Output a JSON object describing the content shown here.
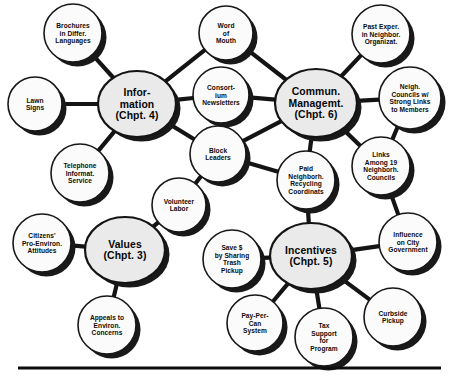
{
  "diagram": {
    "type": "concept-map",
    "title": "",
    "background_color": "#ffffff",
    "edge_color": "#141414",
    "hub_fill": "#eaeaea",
    "leaf_fill": "#fbfbfb",
    "shadow_color": "#191919",
    "hubs": [
      {
        "id": "information",
        "lines": [
          "Infor-",
          "mation",
          "(Chpt. 4)"
        ],
        "cx": 137,
        "cy": 104,
        "rx": 39,
        "ry": 33
      },
      {
        "id": "communication-management",
        "lines": [
          "Commun.",
          "Managemt.",
          "(Chpt. 6)"
        ],
        "cx": 316,
        "cy": 103,
        "rx": 41,
        "ry": 34
      },
      {
        "id": "values",
        "lines": [
          "Values",
          "(Chpt. 3)"
        ],
        "cx": 125,
        "cy": 250,
        "rx": 40,
        "ry": 33
      },
      {
        "id": "incentives",
        "lines": [
          "Incentives",
          "(Chpt. 5)"
        ],
        "cx": 311,
        "cy": 256,
        "rx": 41,
        "ry": 33
      }
    ],
    "leaves": [
      {
        "id": "brochures-different-languages",
        "lines": [
          "Brochures",
          "in Differ.",
          "Languages"
        ],
        "cx": 73,
        "cy": 33,
        "r": 29
      },
      {
        "id": "lawn-signs",
        "lines": [
          "Lawn",
          "Signs"
        ],
        "cx": 35,
        "cy": 104,
        "r": 27
      },
      {
        "id": "telephone-information-service",
        "lines": [
          "Telephone",
          "Informat.",
          "Service"
        ],
        "cx": 80,
        "cy": 173,
        "r": 29
      },
      {
        "id": "word-of-mouth",
        "lines": [
          "Word",
          "of",
          "Mouth"
        ],
        "cx": 226,
        "cy": 33,
        "r": 27
      },
      {
        "id": "consortium-newsletters",
        "lines": [
          "Consort-",
          "ium",
          "Newsletters"
        ],
        "cx": 221,
        "cy": 95,
        "r": 28
      },
      {
        "id": "block-leaders",
        "lines": [
          "Block",
          "Leaders"
        ],
        "cx": 218,
        "cy": 154,
        "r": 28
      },
      {
        "id": "past-experience-neighborhood-organizations",
        "lines": [
          "Past Exper.",
          "in Neighbor.",
          "Organizat."
        ],
        "cx": 381,
        "cy": 34,
        "r": 29
      },
      {
        "id": "neighborhood-councils-strong-links",
        "lines": [
          "Neigh.",
          "Councils w/",
          "Strong Links",
          "to Members"
        ],
        "cx": 410,
        "cy": 98,
        "r": 31
      },
      {
        "id": "links-among-19-councils",
        "lines": [
          "Links",
          "Among 19",
          "Neighborh.",
          "Councils"
        ],
        "cx": 381,
        "cy": 166,
        "r": 29
      },
      {
        "id": "paid-neighborhood-recycling-coordinators",
        "lines": [
          "Paid",
          "Neighborh.",
          "Recycling",
          "Coordinats"
        ],
        "cx": 306,
        "cy": 180,
        "r": 29
      },
      {
        "id": "volunteer-labor",
        "lines": [
          "Volunteer",
          "Labor"
        ],
        "cx": 179,
        "cy": 205,
        "r": 27
      },
      {
        "id": "citizens-pro-environment-attitudes",
        "lines": [
          "Citizens'",
          "Pro-Environ.",
          "Attitudes"
        ],
        "cx": 42,
        "cy": 243,
        "r": 29
      },
      {
        "id": "appeals-to-environmental-concerns",
        "lines": [
          "Appeals to",
          "Environ.",
          "Concerns"
        ],
        "cx": 107,
        "cy": 325,
        "r": 29
      },
      {
        "id": "save-money-sharing-trash-pickup",
        "lines": [
          "Save $",
          "by Sharing",
          "Trash",
          "Pickup"
        ],
        "cx": 232,
        "cy": 259,
        "r": 29
      },
      {
        "id": "influence-on-city-government",
        "lines": [
          "Influence",
          "on City",
          "Government"
        ],
        "cx": 408,
        "cy": 242,
        "r": 29
      },
      {
        "id": "pay-per-can-system",
        "lines": [
          "Pay-Per-",
          "Can",
          "System"
        ],
        "cx": 255,
        "cy": 323,
        "r": 28
      },
      {
        "id": "tax-support-for-program",
        "lines": [
          "Tax",
          "Support",
          "for",
          "Program"
        ],
        "cx": 324,
        "cy": 337,
        "r": 29
      },
      {
        "id": "curbside-pickup",
        "lines": [
          "Curbside",
          "Pickup"
        ],
        "cx": 393,
        "cy": 317,
        "r": 29
      }
    ],
    "edges": [
      {
        "from": "information",
        "to": "brochures-different-languages"
      },
      {
        "from": "information",
        "to": "lawn-signs"
      },
      {
        "from": "information",
        "to": "telephone-information-service"
      },
      {
        "from": "information",
        "to": "word-of-mouth"
      },
      {
        "from": "information",
        "to": "consortium-newsletters"
      },
      {
        "from": "information",
        "to": "block-leaders"
      },
      {
        "from": "communication-management",
        "to": "word-of-mouth"
      },
      {
        "from": "communication-management",
        "to": "consortium-newsletters"
      },
      {
        "from": "communication-management",
        "to": "block-leaders"
      },
      {
        "from": "communication-management",
        "to": "past-experience-neighborhood-organizations"
      },
      {
        "from": "communication-management",
        "to": "neighborhood-councils-strong-links"
      },
      {
        "from": "communication-management",
        "to": "links-among-19-councils"
      },
      {
        "from": "communication-management",
        "to": "paid-neighborhood-recycling-coordinators"
      },
      {
        "from": "neighborhood-councils-strong-links",
        "to": "links-among-19-councils"
      },
      {
        "from": "block-leaders",
        "to": "paid-neighborhood-recycling-coordinators"
      },
      {
        "from": "block-leaders",
        "to": "volunteer-labor"
      },
      {
        "from": "values",
        "to": "volunteer-labor"
      },
      {
        "from": "values",
        "to": "citizens-pro-environment-attitudes"
      },
      {
        "from": "values",
        "to": "appeals-to-environmental-concerns"
      },
      {
        "from": "incentives",
        "to": "paid-neighborhood-recycling-coordinators"
      },
      {
        "from": "incentives",
        "to": "save-money-sharing-trash-pickup"
      },
      {
        "from": "incentives",
        "to": "influence-on-city-government"
      },
      {
        "from": "incentives",
        "to": "pay-per-can-system"
      },
      {
        "from": "incentives",
        "to": "tax-support-for-program"
      },
      {
        "from": "incentives",
        "to": "curbside-pickup"
      },
      {
        "from": "links-among-19-councils",
        "to": "influence-on-city-government"
      }
    ],
    "baseline_rule": {
      "x1": 18,
      "y1": 368,
      "x2": 441,
      "y2": 368
    }
  }
}
